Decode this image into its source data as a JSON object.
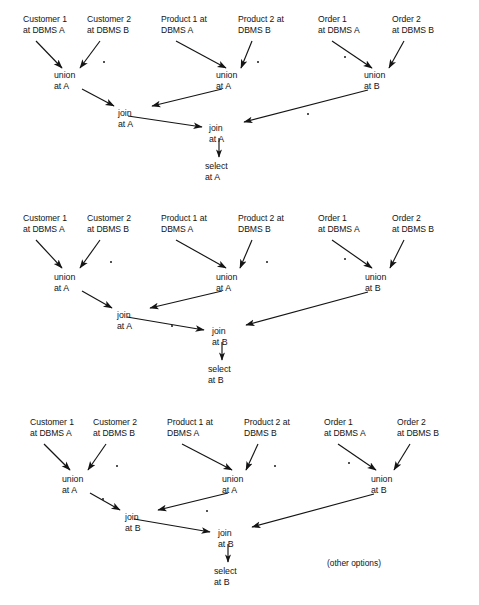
{
  "document": {
    "title": "Distributed query execution plan alternatives",
    "width": 479,
    "height": 605,
    "ink_color": "#141414",
    "background_color": "#ffffff",
    "partial_top_text": "..."
  },
  "labels": {
    "customer1": {
      "line1": "Customer 1",
      "line2": "at DBMS A"
    },
    "customer2": {
      "line1": "Customer 2",
      "line2": "at DBMS B"
    },
    "product1": {
      "line1": "Product 1 at",
      "line2": "DBMS A"
    },
    "product2": {
      "line1": "Product 2 at",
      "line2": "DBMS B"
    },
    "order1": {
      "line1": "Order 1",
      "line2": "at DBMS A"
    },
    "order2": {
      "line1": "Order 2",
      "line2": "at DBMS B"
    }
  },
  "ops": {
    "union_a": {
      "line1": "union",
      "line2": "at A"
    },
    "union_b": {
      "line1": "union",
      "line2": "at B"
    },
    "join_a": {
      "line1": "join",
      "line2": "at A"
    },
    "join_b": {
      "line1": "join",
      "line2": "at B"
    },
    "select_a": {
      "line1": "select",
      "line2": "at A"
    },
    "select_b": {
      "line1": "select",
      "line2": "at B"
    }
  },
  "annotations": {
    "other_options": "(other options)"
  },
  "diagrams": [
    {
      "id": "plan-1",
      "name": "plan-all-at-a",
      "nodes": {
        "leaf_customer1": "customer1",
        "leaf_customer2": "customer2",
        "leaf_product1": "product1",
        "leaf_product2": "product2",
        "leaf_order1": "order1",
        "leaf_order2": "order2",
        "union_left": "union_a",
        "union_mid": "union_a",
        "union_right": "union_b",
        "join_left": "join_a",
        "join_root": "join_a",
        "select": "select_a"
      }
    },
    {
      "id": "plan-2",
      "name": "plan-join-at-b",
      "nodes": {
        "leaf_customer1": "customer1",
        "leaf_customer2": "customer2",
        "leaf_product1": "product1",
        "leaf_product2": "product2",
        "leaf_order1": "order1",
        "leaf_order2": "order2",
        "union_left": "union_a",
        "union_mid": "union_a",
        "union_right": "union_b",
        "join_left": "join_a",
        "join_root": "join_b",
        "select": "select_b"
      }
    },
    {
      "id": "plan-3",
      "name": "plan-both-joins-at-b",
      "nodes": {
        "leaf_customer1": "customer1",
        "leaf_customer2": "customer2",
        "leaf_product1": "product1",
        "leaf_product2": "product2",
        "leaf_order1": "order1",
        "leaf_order2": "order2",
        "union_left": "union_a",
        "union_mid": "union_a",
        "union_right": "union_b",
        "join_left": "join_b",
        "join_root": "join_b",
        "select": "select_b"
      }
    }
  ]
}
